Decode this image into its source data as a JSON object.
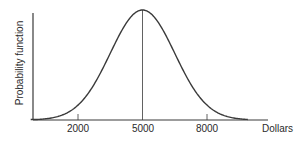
{
  "chart_data": {
    "type": "line",
    "title": "",
    "xlabel": "Dollars",
    "ylabel": "Probability function",
    "xticks": [
      2000,
      5000,
      8000
    ],
    "xtick_labels": [
      "2000",
      "5000",
      "8000"
    ],
    "xlim": [
      -500,
      10000
    ],
    "ylim": [
      0,
      1.05
    ],
    "grid": false,
    "legend": null,
    "annotations": [
      {
        "type": "vertical-line",
        "x": 5000,
        "description": "line from x-axis to peak at mean"
      }
    ],
    "series": [
      {
        "name": "Probability function",
        "shape": "normal (bell) curve",
        "mean": 5000,
        "std_dev": 1500,
        "x": [
          0,
          500,
          1000,
          1500,
          2000,
          2500,
          3000,
          3500,
          4000,
          4500,
          5000,
          5500,
          6000,
          6500,
          7000,
          7500,
          8000,
          8500,
          9000,
          9500,
          10000
        ],
        "values": [
          0.004,
          0.011,
          0.029,
          0.066,
          0.135,
          0.249,
          0.411,
          0.607,
          0.801,
          0.946,
          1.0,
          0.946,
          0.801,
          0.607,
          0.411,
          0.249,
          0.135,
          0.066,
          0.029,
          0.011,
          0.004
        ]
      }
    ],
    "colors": {
      "line": "#3a3a3a",
      "axis": "#3a3a3a",
      "text": "#2a2a2a",
      "background": "#ffffff"
    }
  },
  "labels": {
    "y_axis": "Probability function",
    "x_axis": "Dollars",
    "ticks": [
      "2000",
      "5000",
      "8000"
    ]
  }
}
